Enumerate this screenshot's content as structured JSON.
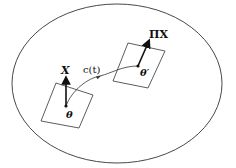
{
  "diagram": {
    "type": "manifold-parallel-transport",
    "manifold": {
      "shape": "ellipse"
    },
    "start_point": {
      "label": "θ",
      "tangent_vector_label": "X"
    },
    "end_point": {
      "label": "θ′",
      "tangent_vector_label": "ΠX"
    },
    "curve": {
      "label": "c(t)"
    }
  },
  "labels": {
    "vector_x": "X",
    "vector_pi_x": "ΠX",
    "curve": "c(t)",
    "theta": "θ",
    "theta_prime": "θ′"
  },
  "colors": {
    "stroke": "#222222",
    "background": "#ffffff"
  }
}
